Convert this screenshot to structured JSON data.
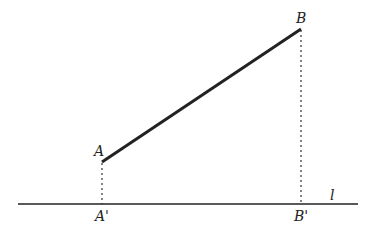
{
  "diagram": {
    "points": {
      "A": {
        "label": "A",
        "x": 102,
        "y": 162
      },
      "B": {
        "label": "B",
        "x": 301,
        "y": 29
      },
      "A_proj": {
        "label": "A'",
        "x": 102,
        "y": 204
      },
      "B_proj": {
        "label": "B'",
        "x": 301,
        "y": 204
      }
    },
    "line": {
      "label": "l",
      "x1": 18,
      "x2": 358,
      "y": 204
    },
    "colors": {
      "stroke": "#222222"
    }
  }
}
